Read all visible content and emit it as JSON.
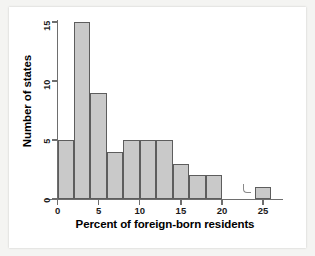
{
  "chart_data": {
    "type": "bar",
    "title": "",
    "subtitle": "",
    "xlabel": "Percent of foreign-born residents",
    "ylabel": "Number of states",
    "xlim": [
      0,
      28
    ],
    "ylim": [
      0,
      16
    ],
    "xticks": [
      "0",
      "5",
      "10",
      "15",
      "20",
      "25"
    ],
    "xtick_values": [
      0,
      5,
      10,
      15,
      20,
      25
    ],
    "yticks": [
      "0",
      "5",
      "10",
      "15"
    ],
    "ytick_values": [
      0,
      5,
      10,
      15
    ],
    "bin_width": 2,
    "grid": false,
    "legend": null,
    "bar_fill_color": "#c9c9c9",
    "bar_edge_color": "#5d5d5d",
    "axis_color": "#6e6e6e",
    "categories": [
      "0-2",
      "2-4",
      "4-6",
      "6-8",
      "8-10",
      "10-12",
      "12-14",
      "14-16",
      "16-18",
      "18-20",
      "20-22",
      "22-24",
      "24-26"
    ],
    "bin_edges": [
      0,
      2,
      4,
      6,
      8,
      10,
      12,
      14,
      16,
      18,
      20,
      22,
      24,
      26
    ],
    "values": [
      5,
      15,
      9,
      4,
      5,
      5,
      5,
      3,
      2,
      2,
      0,
      0,
      1
    ],
    "annotations": [
      "scan-artifact"
    ]
  },
  "axis_titles": {
    "x": "Percent of foreign-born residents",
    "y": "Number of states"
  }
}
